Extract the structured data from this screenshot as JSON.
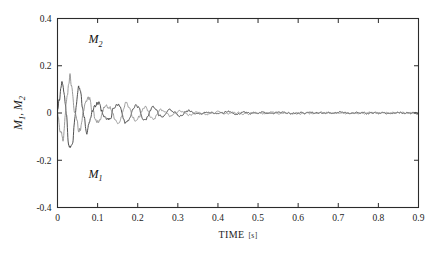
{
  "figure": {
    "background": "#ffffff",
    "frame_color": "#2b2b2b"
  },
  "chart_data": {
    "type": "line",
    "title": "",
    "xlabel": "TIME",
    "xunit": "[s]",
    "xlabel_full": "TIME [s]",
    "ylabel": "M",
    "ylabel_full": "M1, M2",
    "ylabel_parts": {
      "m": "M",
      "sub1": "1",
      "comma": ",",
      "sub2": "2"
    },
    "xlim": [
      0,
      0.9
    ],
    "ylim": [
      -0.4,
      0.4
    ],
    "xticks": [
      0,
      0.1,
      0.2,
      0.3,
      0.4,
      0.5,
      0.6,
      0.7,
      0.8,
      0.9
    ],
    "xticklabels": [
      "0",
      "0.1",
      "0.2",
      "0.3",
      "0.4",
      "0.5",
      "0.6",
      "0.7",
      "0.8",
      "0.9"
    ],
    "yticks": [
      -0.4,
      -0.2,
      0,
      0.2,
      0.4
    ],
    "yticklabels": [
      "-0.4",
      "-0.2",
      "0",
      "0.2",
      "0.4"
    ],
    "grid": false,
    "legend": "inline-annotations",
    "annotations": [
      {
        "text": "M",
        "subscript": "2",
        "x": 0.077,
        "y": 0.295,
        "name": "m2-label"
      },
      {
        "text": "M",
        "subscript": "1",
        "x": 0.077,
        "y": -0.275,
        "name": "m1-label"
      }
    ],
    "series": [
      {
        "name": "M2",
        "color": "#3c3c3c",
        "linewidth": 0.9,
        "phase_deg": 0,
        "amplitude_initial": 0.25,
        "frequency_hz": 22,
        "decay_tau_s": 0.105,
        "noise_level": 0.012,
        "description": "Damped oscillation, positive first peak ~0.25 at t=0.05, decays to noise floor by t=0.45"
      },
      {
        "name": "M1",
        "color": "#8e8e8e",
        "linewidth": 0.9,
        "phase_deg": 180,
        "amplitude_initial": 0.24,
        "frequency_hz": 22,
        "decay_tau_s": 0.105,
        "noise_level": 0.012,
        "description": "Damped oscillation in antiphase with M2, negative first trough ~-0.24 at t=0.055"
      }
    ]
  }
}
